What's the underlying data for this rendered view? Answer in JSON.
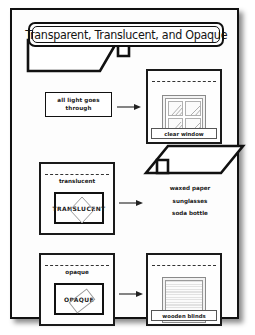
{
  "slide": {
    "title": "Transparent, Translucent, and Opaque"
  },
  "rows": [
    {
      "id": "transparent",
      "beam_icon": "light-beam-parallelogram",
      "description_lines": [
        "all light goes",
        "through"
      ],
      "arrow_icon": "arrow-right-icon",
      "panel": {
        "title": "",
        "art_icon": "window-four-pane-icon",
        "caption": "clear window"
      }
    },
    {
      "id": "translucent",
      "beam_icon": "light-beam-parallelogram",
      "panel": {
        "title": "translucent",
        "word": "TRANSLUCENT",
        "overlay_icon": "diamond-outline-icon"
      },
      "arrow_icon": "arrow-right-icon",
      "examples": [
        "waxed paper",
        "sunglasses",
        "soda bottle"
      ]
    },
    {
      "id": "opaque",
      "panel": {
        "title": "opaque",
        "word": "OPAQUE",
        "overlay_icon": "rotated-rectangle-icon"
      },
      "arrow_icon": "arrow-right-icon",
      "result_panel": {
        "art_icon": "wooden-blinds-icon",
        "caption": "wooden blinds"
      }
    }
  ],
  "colors": {
    "ink": "#111111",
    "sheet": "#fdfdfd",
    "page_background": "#ffffff"
  }
}
